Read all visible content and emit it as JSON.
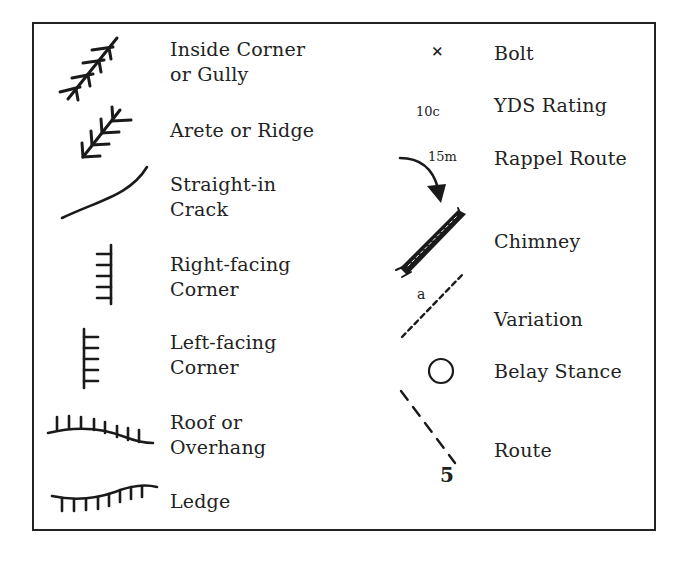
{
  "legend": {
    "left_column": [
      {
        "symbol": "inside-corner-icon",
        "label": "Inside Corner\nor Gully"
      },
      {
        "symbol": "arete-icon",
        "label": "Arete or Ridge"
      },
      {
        "symbol": "straight-crack-icon",
        "label": "Straight-in\nCrack"
      },
      {
        "symbol": "right-facing-corner-icon",
        "label": "Right-facing\nCorner"
      },
      {
        "symbol": "left-facing-corner-icon",
        "label": "Left-facing\nCorner"
      },
      {
        "symbol": "roof-icon",
        "label": "Roof or\nOverhang"
      },
      {
        "symbol": "ledge-icon",
        "label": "Ledge"
      }
    ],
    "right_column": [
      {
        "symbol": "bolt-icon",
        "glyph": "×",
        "label": "Bolt"
      },
      {
        "symbol": "yds-rating-icon",
        "glyph": "10c",
        "label": "YDS Rating"
      },
      {
        "symbol": "rappel-icon",
        "glyph": "15m",
        "label": "Rappel Route"
      },
      {
        "symbol": "chimney-icon",
        "label": "Chimney"
      },
      {
        "symbol": "variation-icon",
        "glyph": "a",
        "label": "Variation"
      },
      {
        "symbol": "belay-stance-icon",
        "label": "Belay Stance"
      },
      {
        "symbol": "route-icon",
        "glyph": "5",
        "label": "Route"
      }
    ]
  },
  "colors": {
    "ink": "#222222",
    "background": "#ffffff"
  }
}
